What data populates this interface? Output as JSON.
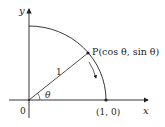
{
  "diagram": {
    "type": "unit-circle-quadrant",
    "colors": {
      "stroke": "#231f20",
      "background": "#ffffff"
    },
    "axes": {
      "x_label": "x",
      "y_label": "y",
      "origin_label": "0"
    },
    "points": {
      "p_label": "P(cos θ, sin θ)",
      "unit_point_label": "(1, 0)"
    },
    "radius_label": "1",
    "angle_label": "θ"
  }
}
